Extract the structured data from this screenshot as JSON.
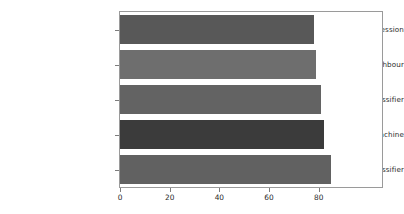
{
  "chart_data": {
    "type": "bar",
    "orientation": "horizontal",
    "title": "",
    "xlabel": "",
    "ylabel": "",
    "categories": [
      "Logistic Regression",
      "K Nearest Neighbour",
      "Decision Tree Classifier",
      "Support Vector Machine",
      "Random forest classifier"
    ],
    "values": [
      78,
      79,
      81,
      82,
      85
    ],
    "bar_colors": [
      "#585858",
      "#6e6e6e",
      "#636363",
      "#3b3b3b",
      "#616161"
    ],
    "xlim": [
      0,
      105.5
    ],
    "xticks": [
      0,
      20,
      40,
      60,
      80
    ],
    "xticklabels": [
      "0",
      "20",
      "40",
      "60",
      "80"
    ],
    "grid": false,
    "legend": null,
    "frame_color": "#9a9a9a",
    "background": "#ffffff"
  }
}
